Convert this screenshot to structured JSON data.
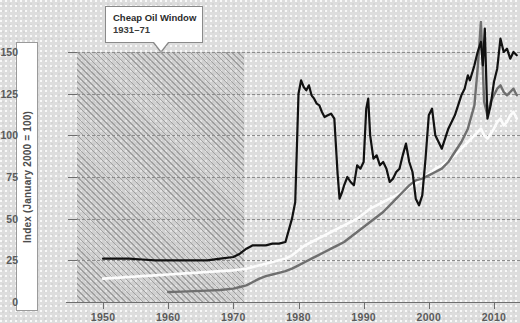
{
  "chart_data": {
    "type": "line",
    "title": "",
    "xlabel": "",
    "ylabel": "Index (January 2000 = 100)",
    "xlim": [
      1946,
      2014
    ],
    "ylim": [
      0,
      150
    ],
    "grid": true,
    "legend_position": "none",
    "x_ticks": [
      "1950",
      "1960",
      "1970",
      "1980",
      "1990",
      "2000",
      "2010"
    ],
    "y_ticks": [
      "0",
      "25",
      "50",
      "75",
      "100",
      "125",
      "150"
    ],
    "annotations": [
      {
        "name": "cheap-oil-window",
        "title": "Cheap Oil Window",
        "subtitle": "1931–71",
        "span_start": 1931,
        "span_end": 1971,
        "style": "hatched-band"
      }
    ],
    "series": [
      {
        "name": "black-series",
        "color": "#111111",
        "x": [
          1950,
          1952,
          1954,
          1956,
          1958,
          1960,
          1962,
          1964,
          1966,
          1968,
          1970,
          1971,
          1972,
          1973,
          1974,
          1975,
          1976,
          1977,
          1978,
          1979,
          1979.5,
          1980,
          1980.4,
          1980.8,
          1981.2,
          1981.6,
          1982,
          1982.4,
          1982.8,
          1983.2,
          1983.6,
          1984,
          1984.5,
          1985,
          1985.5,
          1986,
          1986.3,
          1986.7,
          1987,
          1987.5,
          1988,
          1988.5,
          1989,
          1989.5,
          1990,
          1990.4,
          1990.7,
          1991,
          1991.5,
          1992,
          1992.5,
          1993,
          1993.5,
          1994,
          1994.5,
          1995,
          1995.5,
          1996,
          1996.5,
          1997,
          1997.5,
          1998,
          1998.5,
          1999,
          1999.5,
          2000,
          2000.5,
          2001,
          2001.5,
          2002,
          2002.5,
          2003,
          2003.5,
          2004,
          2004.5,
          2005,
          2005.5,
          2006,
          2006.3,
          2006.7,
          2007,
          2007.5,
          2008,
          2008.3,
          2008.6,
          2009,
          2009.5,
          2010,
          2010.5,
          2011,
          2011.5,
          2012,
          2012.5,
          2013,
          2013.5
        ],
        "y": [
          26,
          26,
          26,
          25.5,
          25,
          25,
          25,
          25,
          25,
          26,
          27,
          29,
          32,
          34,
          34,
          34,
          35,
          35,
          36,
          50,
          60,
          125,
          133,
          129,
          127,
          130,
          124,
          122,
          119,
          118,
          114,
          111,
          112,
          113,
          110,
          77,
          62,
          66,
          70,
          75,
          72,
          70,
          82,
          80,
          84,
          116,
          122,
          100,
          86,
          88,
          82,
          84,
          80,
          72,
          74,
          78,
          80,
          88,
          95,
          84,
          78,
          62,
          58,
          64,
          86,
          112,
          116,
          100,
          96,
          92,
          98,
          104,
          108,
          112,
          118,
          124,
          128,
          136,
          133,
          138,
          142,
          150,
          156,
          142,
          164,
          110,
          118,
          132,
          140,
          158,
          150,
          152,
          146,
          150,
          148
        ]
      },
      {
        "name": "gray-series",
        "color": "#6f6f6f",
        "x": [
          1960,
          1962,
          1964,
          1966,
          1968,
          1970,
          1971,
          1972,
          1973,
          1974,
          1975,
          1976,
          1977,
          1978,
          1979,
          1980,
          1981,
          1982,
          1983,
          1984,
          1985,
          1986,
          1987,
          1988,
          1989,
          1990,
          1991,
          1992,
          1993,
          1994,
          1995,
          1996,
          1997,
          1998,
          1999,
          2000,
          2001,
          2002,
          2003,
          2004,
          2005,
          2006,
          2007,
          2007.5,
          2008,
          2008.5,
          2009,
          2009.5,
          2010,
          2010.5,
          2011,
          2011.5,
          2012,
          2012.5,
          2013,
          2013.5
        ],
        "y": [
          6,
          6.2,
          6.5,
          6.8,
          7.2,
          8,
          9,
          10,
          12,
          14,
          15.5,
          16.5,
          17.5,
          18.5,
          20,
          22,
          24,
          26,
          28,
          30,
          32,
          34,
          36,
          39,
          42,
          45,
          48,
          51,
          54,
          58,
          62,
          66,
          70,
          73,
          74,
          76,
          78,
          80,
          84,
          90,
          96,
          104,
          118,
          140,
          168,
          120,
          112,
          120,
          124,
          128,
          130,
          126,
          124,
          126,
          128,
          124
        ]
      },
      {
        "name": "white-series",
        "color": "#fcfcfc",
        "x": [
          1950,
          1952,
          1954,
          1956,
          1958,
          1960,
          1962,
          1964,
          1966,
          1968,
          1970,
          1971,
          1972,
          1973,
          1974,
          1975,
          1976,
          1977,
          1978,
          1979,
          1980,
          1981,
          1982,
          1983,
          1984,
          1985,
          1986,
          1987,
          1988,
          1989,
          1990,
          1991,
          1992,
          1993,
          1994,
          1995,
          1996,
          1997,
          1998,
          1999,
          2000,
          2001,
          2002,
          2003,
          2004,
          2005,
          2006,
          2007,
          2008,
          2008.5,
          2009,
          2009.5,
          2010,
          2010.5,
          2011,
          2011.5,
          2012,
          2012.5,
          2013,
          2013.5
        ],
        "y": [
          14,
          14.5,
          15,
          15.5,
          16,
          16.5,
          17,
          17.5,
          18,
          18.5,
          19,
          19.5,
          20,
          21,
          22,
          23,
          24,
          25,
          26,
          28,
          31,
          34,
          36,
          38,
          40,
          42,
          44,
          46,
          48,
          50,
          53,
          56,
          58,
          60,
          62,
          64,
          66,
          69,
          71,
          74,
          77,
          80,
          82,
          85,
          88,
          92,
          96,
          100,
          104,
          100,
          98,
          101,
          104,
          108,
          110,
          106,
          108,
          112,
          114,
          110
        ]
      }
    ]
  },
  "y_axis": {
    "title": "Index (January 2000 = 100)"
  },
  "callout": {
    "title": "Cheap Oil Window",
    "subtitle": "1931–71"
  },
  "colors": {
    "background": "#dddddd",
    "black_series": "#111111",
    "gray_series": "#6f6f6f",
    "white_series": "#fcfcfc",
    "gridline": "#8d8d8d",
    "axis": "#6e6e6e",
    "tick_label": "#5b5b5b"
  }
}
